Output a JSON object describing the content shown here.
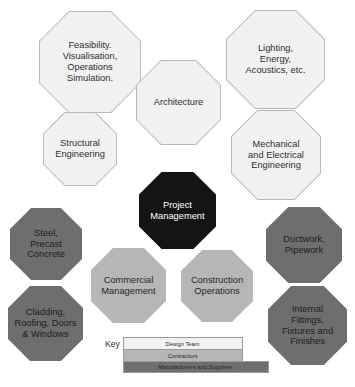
{
  "diagram": {
    "core": {
      "label": "Project\nManagement",
      "category": "core",
      "color": "#141414",
      "text_color": "#ffffff"
    },
    "nodes": [
      {
        "id": "feasibility",
        "label": "Feasibility.\nVisualisation,\nOperations\nSimulation.",
        "category": "design-team",
        "color": "#f1f1f1"
      },
      {
        "id": "lighting",
        "label": "Lighting,\nEnergy,\nAcoustics, etc.",
        "category": "design-team",
        "color": "#f1f1f1"
      },
      {
        "id": "architecture",
        "label": "Architecture",
        "category": "design-team",
        "color": "#f1f1f1"
      },
      {
        "id": "structural-engineering",
        "label": "Structural\nEngineering",
        "category": "design-team",
        "color": "#f1f1f1"
      },
      {
        "id": "mechanical-electrical-engineering",
        "label": "Mechanical\nand Electrical\nEngineering",
        "category": "design-team",
        "color": "#f1f1f1"
      },
      {
        "id": "steel-precast-concrete",
        "label": "Steel,\nPrecast\nConcrete",
        "category": "manufacturers-and-suppliers",
        "color": "#6e6e6e"
      },
      {
        "id": "ductwork-pipework",
        "label": "Ductwork,\nPipework",
        "category": "manufacturers-and-suppliers",
        "color": "#6e6e6e"
      },
      {
        "id": "commercial-management",
        "label": "Commercial\nManagement",
        "category": "contractors",
        "color": "#b6b6b6"
      },
      {
        "id": "construction-operations",
        "label": "Construction\nOperations",
        "category": "contractors",
        "color": "#b6b6b6"
      },
      {
        "id": "cladding-roofing-doors-windows",
        "label": "Cladding,\nRoofing, Doors\n& Windows",
        "category": "manufacturers-and-suppliers",
        "color": "#6e6e6e"
      },
      {
        "id": "internal-fittings-fixtures-finishes",
        "label": "Internal\nFittings,\nFixtures and\nFinishes",
        "category": "manufacturers-and-suppliers",
        "color": "#6e6e6e"
      }
    ]
  },
  "key": {
    "title": "Key",
    "rows": [
      {
        "label": "Design Team",
        "color": "#f1f1f1"
      },
      {
        "label": "Contractors",
        "color": "#b6b6b6"
      },
      {
        "label": "Manufacturers and Suppliers",
        "color": "#6e6e6e"
      }
    ]
  }
}
